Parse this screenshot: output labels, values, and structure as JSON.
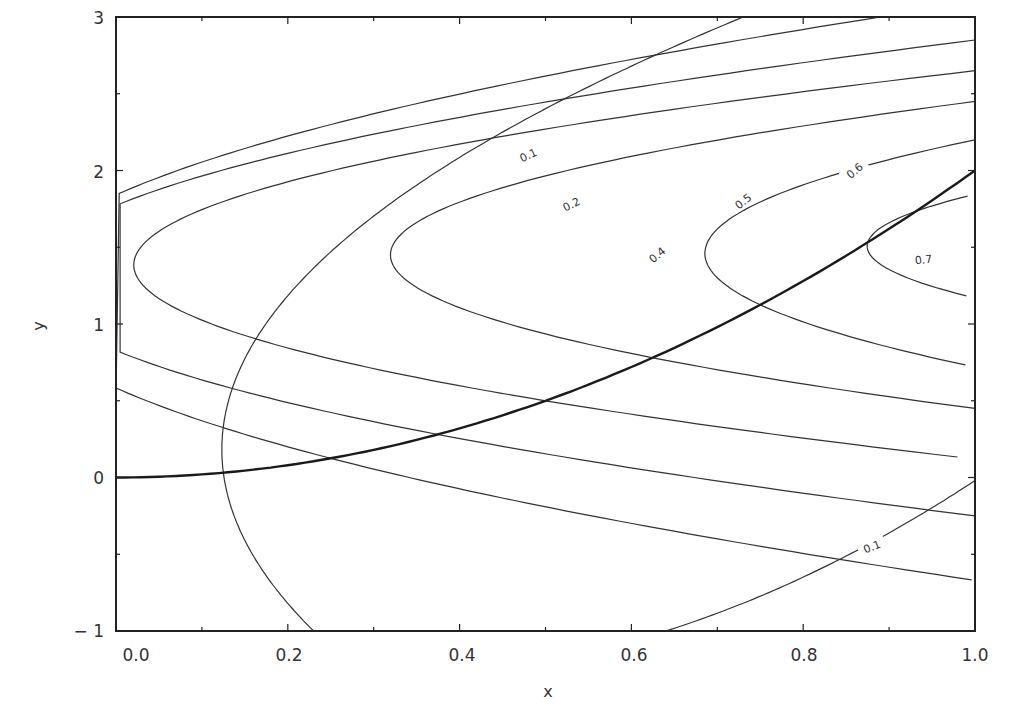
{
  "chart_data": {
    "type": "contour",
    "title": "",
    "xlabel": "x",
    "ylabel": "y",
    "xlim": [
      0.0,
      1.0
    ],
    "ylim": [
      -1,
      3
    ],
    "grid": false,
    "legend": null,
    "x_ticks": [
      "0.0",
      "0.2",
      "0.4",
      "0.6",
      "0.8",
      "1.0"
    ],
    "y_ticks": [
      "-1",
      "0",
      "1",
      "2",
      "3"
    ],
    "contour_levels": [
      0.1,
      0.2,
      0.3,
      0.4,
      0.5,
      0.6,
      0.7
    ],
    "contour_labels_shown": [
      "0.1",
      "0.2",
      "0.4",
      "0.5",
      "0.6",
      "0.7",
      "0.1"
    ],
    "ridge_curve": {
      "description": "thick curve through contour vertices, approx y = 2x^2",
      "points": [
        [
          0.0,
          0.0
        ],
        [
          0.125,
          0.03
        ],
        [
          0.25,
          0.125
        ],
        [
          0.375,
          0.28
        ],
        [
          0.5,
          0.5
        ],
        [
          0.625,
          0.78
        ],
        [
          0.75,
          1.125
        ],
        [
          0.875,
          1.53
        ],
        [
          1.0,
          2.0
        ]
      ]
    },
    "contours": [
      {
        "level": 0.1,
        "vertex": [
          0.125,
          0.03
        ],
        "upper_end": [
          0.73,
          3.0
        ],
        "lower_end": [
          0.23,
          -1.0
        ]
      },
      {
        "level": 0.2,
        "vertex": [
          0.25,
          0.125
        ],
        "upper_end": [
          0.89,
          3.0
        ],
        "lower_end": [
          1.0,
          -0.67
        ]
      },
      {
        "level": 0.3,
        "vertex": [
          0.375,
          0.28
        ],
        "upper_end": [
          1.0,
          2.85
        ],
        "lower_end": [
          1.0,
          -0.25
        ]
      },
      {
        "level": 0.4,
        "vertex": [
          0.5,
          0.5
        ],
        "upper_end": [
          1.0,
          2.65
        ],
        "lower_end": [
          1.0,
          0.12
        ]
      },
      {
        "level": 0.5,
        "vertex": [
          0.625,
          0.78
        ],
        "upper_end": [
          1.0,
          2.45
        ],
        "lower_end": [
          1.0,
          0.45
        ]
      },
      {
        "level": 0.6,
        "vertex": [
          0.75,
          1.125
        ],
        "upper_end": [
          1.0,
          2.2
        ],
        "lower_end": [
          1.0,
          0.72
        ]
      },
      {
        "level": 0.7,
        "vertex": [
          0.875,
          1.53
        ],
        "upper_end": [
          1.0,
          1.5
        ],
        "lower_end": [
          1.0,
          1.5
        ]
      },
      {
        "level": 0.1,
        "branch": "lower-right",
        "start": [
          0.64,
          -1.0
        ],
        "end": [
          1.0,
          -0.02
        ]
      }
    ],
    "label_positions": [
      {
        "text": "0.1",
        "x": 0.48,
        "y": 2.1,
        "angle": -25
      },
      {
        "text": "0.2",
        "x": 0.53,
        "y": 1.78,
        "angle": -27
      },
      {
        "text": "0.4",
        "x": 0.63,
        "y": 1.45,
        "angle": -40
      },
      {
        "text": "0.5",
        "x": 0.73,
        "y": 1.8,
        "angle": -38
      },
      {
        "text": "0.6",
        "x": 0.86,
        "y": 2.0,
        "angle": -40
      },
      {
        "text": "0.7",
        "x": 0.94,
        "y": 1.42,
        "angle": -5
      },
      {
        "text": "0.1",
        "x": 0.88,
        "y": -0.45,
        "angle": -22
      }
    ]
  }
}
